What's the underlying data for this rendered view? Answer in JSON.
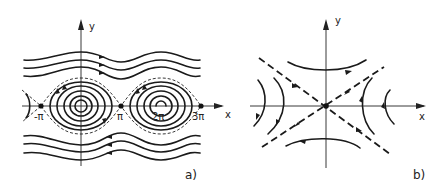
{
  "panel_a": {
    "label": "a)",
    "axis_x_label": "x",
    "axis_y_label": "y",
    "ticks": [
      "-π",
      "π",
      "2π",
      "3π"
    ],
    "description": "Phase portrait of pendulum: wavy rotational orbits, closed librations around centers at 0 and 2π, saddle points at -π, π, 3π with separatrices"
  },
  "panel_b": {
    "label": "b)",
    "axis_x_label": "x",
    "axis_y_label": "y",
    "description": "Saddle point at origin with hyperbolic trajectories and dashed separatrix asymptotes"
  },
  "colors": {
    "ink": "#1a1a1a",
    "background": "#ffffff"
  }
}
